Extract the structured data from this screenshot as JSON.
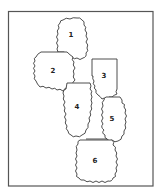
{
  "diagram": {
    "type": "numbered-region-map",
    "frame_color": "#555555",
    "outline_color": "#3a3a3a",
    "regions": [
      {
        "label": "1"
      },
      {
        "label": "2"
      },
      {
        "label": "3"
      },
      {
        "label": "4"
      },
      {
        "label": "5"
      },
      {
        "label": "6"
      }
    ]
  }
}
